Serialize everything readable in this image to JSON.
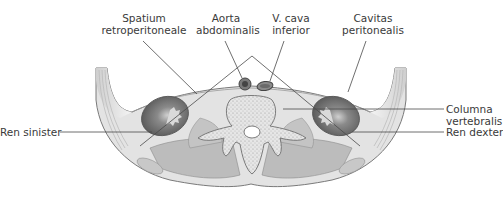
{
  "diagram": {
    "type": "anatomical-cross-section",
    "colors": {
      "background": "#ffffff",
      "body_fill": "#dcdcdc",
      "muscle": "#b9b9b9",
      "kidney": "#5e5e5e",
      "bone": "#e4e4e4",
      "outline": "#6a6a6a",
      "leader_line": "#444444"
    },
    "labels": {
      "spatium": {
        "line1": "Spatium",
        "line2": "retroperitoneale"
      },
      "aorta": {
        "line1": "Aorta",
        "line2": "abdominalis"
      },
      "vcava": {
        "line1": "V. cava",
        "line2": "inferior"
      },
      "cavitas": {
        "line1": "Cavitas",
        "line2": "peritonealis"
      },
      "columna": {
        "line1": "Columna",
        "line2": "vertebralis"
      },
      "ren_sinister": "Ren sinister",
      "ren_dexter": "Ren dexter"
    }
  }
}
